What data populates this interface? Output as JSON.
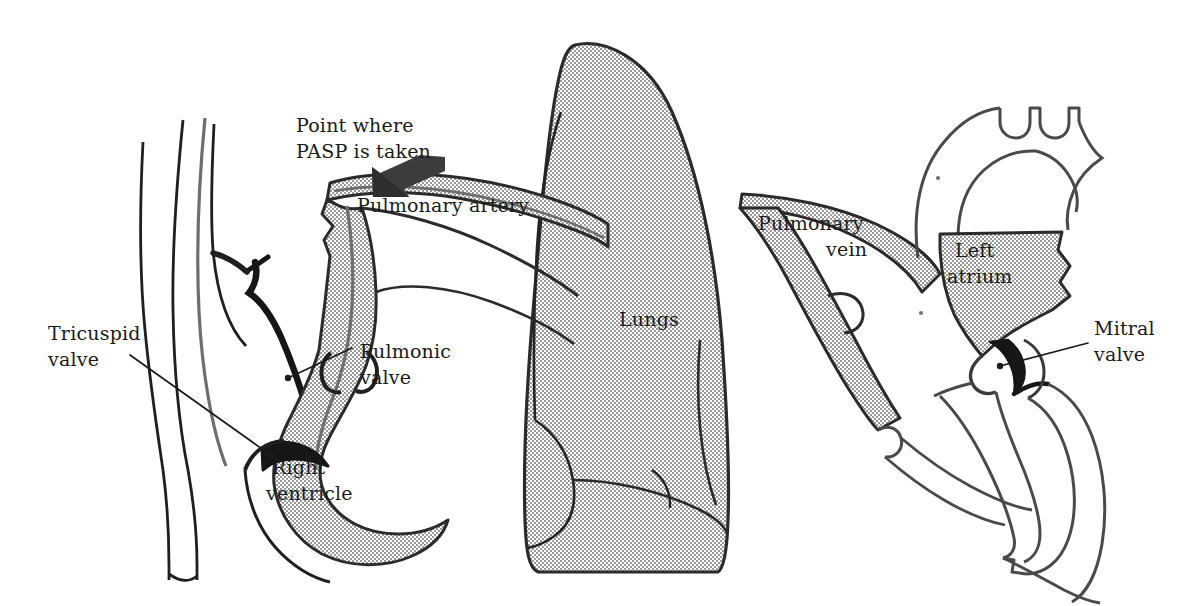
{
  "figure": {
    "background_color": "#ffffff",
    "ink_color": "#1a1a1a",
    "mid_gray_color": "#6e6e6e",
    "stipple_fill_color": "#b4b4b4",
    "arrow_color": "#3c3c3c"
  },
  "annotations": {
    "point_where": {
      "line1": "Point where",
      "line2": "PASP is taken",
      "x": 296,
      "y": 132
    },
    "pulmonary_artery": {
      "text": "Pulmonary artery",
      "x": 357,
      "y": 212
    },
    "tricuspid_valve": {
      "line1": "Tricuspid",
      "line2": "valve",
      "x": 48,
      "y": 340
    },
    "pulmonic_valve": {
      "line1": "Pulmonic",
      "line2": "valve",
      "x": 360,
      "y": 358
    },
    "right_ventricle": {
      "line1": "Right",
      "line2": "ventricle",
      "x": 272,
      "y": 474
    },
    "lungs": {
      "text": "Lungs",
      "x": 619,
      "y": 326
    },
    "pulmonary_vein": {
      "line1": "Pulmonary",
      "line2": "vein",
      "x": 758,
      "y": 230
    },
    "left_atrium": {
      "line1": "Left",
      "line2": "atrium",
      "x": 955,
      "y": 257
    },
    "mitral_valve": {
      "line1": "Mitral",
      "line2": "valve",
      "x": 1094,
      "y": 335
    }
  },
  "icons": {
    "pasp_arrow": "down-left-block-arrow"
  }
}
